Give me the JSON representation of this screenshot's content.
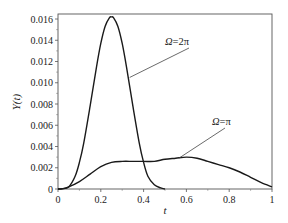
{
  "chart_data": {
    "type": "line",
    "title": "",
    "xlabel": "t",
    "ylabel": "Υ(t)",
    "xlim": [
      0,
      1
    ],
    "ylim": [
      0,
      0.0165
    ],
    "grid": false,
    "legend": "inline annotations",
    "xticks": [
      0,
      0.2,
      0.4,
      0.6,
      0.8,
      1
    ],
    "xtick_labels": [
      "0",
      "0.2",
      "0.4",
      "0.6",
      "0.8",
      "1"
    ],
    "yticks": [
      0,
      0.002,
      0.004,
      0.006,
      0.008,
      0.01,
      0.012,
      0.014,
      0.016
    ],
    "ytick_labels": [
      "0",
      "0.002",
      "0.004",
      "0.006",
      "0.008",
      "0.010",
      "0.012",
      "0.014",
      "0.016"
    ],
    "series": [
      {
        "name": "Ω=2π",
        "x": [
          0,
          0.02,
          0.05,
          0.08,
          0.1,
          0.12,
          0.15,
          0.18,
          0.2,
          0.22,
          0.24,
          0.25,
          0.26,
          0.28,
          0.3,
          0.32,
          0.35,
          0.38,
          0.4,
          0.42,
          0.45,
          0.48,
          0.5
        ],
        "values": [
          0,
          2e-05,
          0.0002,
          0.0012,
          0.0025,
          0.0043,
          0.0078,
          0.0115,
          0.0137,
          0.0153,
          0.0161,
          0.0162,
          0.0161,
          0.0153,
          0.0137,
          0.0115,
          0.0078,
          0.0043,
          0.0025,
          0.0012,
          0.0004,
          0.0001,
          0
        ]
      },
      {
        "name": "Ω=π",
        "x": [
          0,
          0.02,
          0.05,
          0.1,
          0.15,
          0.2,
          0.25,
          0.3,
          0.35,
          0.4,
          0.45,
          0.5,
          0.55,
          0.6,
          0.65,
          0.7,
          0.75,
          0.8,
          0.85,
          0.9,
          0.95,
          1.0
        ],
        "values": [
          0,
          3e-05,
          0.0002,
          0.0007,
          0.0014,
          0.0021,
          0.0025,
          0.0026,
          0.0026,
          0.0026,
          0.0026,
          0.0028,
          0.0029,
          0.003,
          0.0029,
          0.0026,
          0.0023,
          0.002,
          0.0016,
          0.0011,
          0.0006,
          0.0002
        ]
      }
    ],
    "annotations": [
      {
        "text": "Ω=2π",
        "label_at": [
          0.6,
          0.0132
        ],
        "arrow_to": [
          0.33,
          0.0107
        ]
      },
      {
        "text": "Ω=π",
        "label_at": [
          0.76,
          0.0039
        ],
        "arrow_to": [
          0.57,
          0.0029
        ]
      }
    ]
  },
  "labels": {
    "xlabel": "t",
    "ylabel": "Υ(t)",
    "annot_2pi_sym": "Ω",
    "annot_2pi_rest": "=2π",
    "annot_pi_sym": "Ω",
    "annot_pi_rest": "=π"
  }
}
